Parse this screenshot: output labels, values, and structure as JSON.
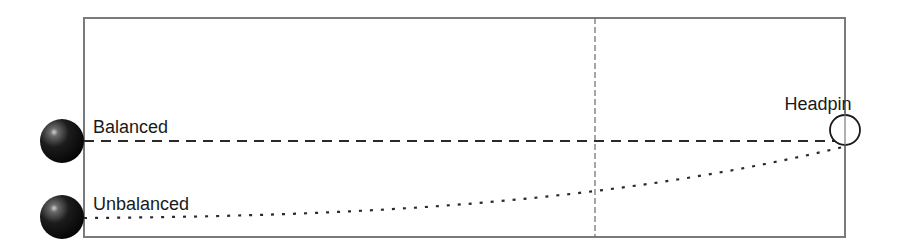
{
  "diagram": {
    "type": "bowling-ball-trajectory",
    "lane": {
      "x": 84,
      "y": 18,
      "width": 761,
      "height": 219,
      "stroke": "#7a7a7a"
    },
    "midline": {
      "x": 595,
      "y1": 18,
      "y2": 237,
      "stroke": "#6a6a6a"
    },
    "balls": [
      {
        "id": "balanced",
        "cx": 62,
        "cy": 141,
        "r": 22
      },
      {
        "id": "unbalanced",
        "cx": 62,
        "cy": 217,
        "r": 22
      }
    ],
    "headpin": {
      "label": "Headpin",
      "cx": 845,
      "cy": 130,
      "r": 15
    },
    "trajectories": [
      {
        "id": "balanced",
        "label": "Balanced",
        "style": "dashed"
      },
      {
        "id": "unbalanced",
        "label": "Unbalanced",
        "style": "dotted"
      }
    ],
    "colors": {
      "line": "#2a2a2a",
      "ball_dark": "#111111",
      "ball_highlight": "#cfcfcf"
    }
  }
}
